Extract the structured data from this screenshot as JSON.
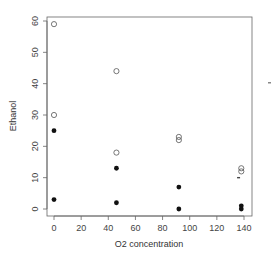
{
  "chart_data": {
    "type": "scatter",
    "title": "",
    "xlabel": "O2 concentration",
    "ylabel": "Ethanol",
    "xlim": [
      -3,
      145
    ],
    "ylim": [
      -2,
      62
    ],
    "x_ticks": [
      0,
      20,
      40,
      60,
      80,
      100,
      120,
      140
    ],
    "y_ticks": [
      0,
      10,
      20,
      30,
      40,
      50,
      60
    ],
    "grid": false,
    "legend": null,
    "series": [
      {
        "name": "open",
        "marker": "open-circle",
        "points": [
          [
            0,
            59
          ],
          [
            0,
            30
          ],
          [
            46,
            44
          ],
          [
            46,
            18
          ],
          [
            92,
            23
          ],
          [
            92,
            22
          ],
          [
            138,
            13
          ],
          [
            138,
            12
          ]
        ]
      },
      {
        "name": "filled",
        "marker": "filled-circle",
        "points": [
          [
            0,
            25
          ],
          [
            0,
            3
          ],
          [
            46,
            13
          ],
          [
            46,
            2
          ],
          [
            92,
            7
          ],
          [
            92,
            0
          ],
          [
            138,
            1
          ],
          [
            138,
            0
          ]
        ]
      },
      {
        "name": "dash",
        "marker": "dash",
        "points": [
          [
            136,
            10
          ]
        ]
      }
    ]
  },
  "colors": {
    "axis": "#555555",
    "point": "#111111",
    "open_point": "#555555"
  }
}
